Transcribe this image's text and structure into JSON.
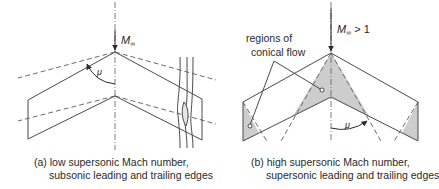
{
  "figure": {
    "left_panel": {
      "freestream_label": "M",
      "freestream_sub": "∞",
      "angle_label": "μ",
      "caption_line1": "(a) low supersonic Mach number,",
      "caption_line2": "subsonic leading and trailing edges"
    },
    "right_panel": {
      "freestream_label": "M",
      "freestream_sub": "∞",
      "freestream_suffix": " > 1",
      "angle_label": "μ",
      "annotation_line1": "regions of",
      "annotation_line2": "conical flow",
      "caption_line1": "(b) high supersonic Mach number,",
      "caption_line2": "supersonic leading and trailing edges"
    },
    "colors": {
      "line": "#4a4a4a",
      "shade": "#cdcdcd",
      "background": "#ffffff"
    }
  }
}
